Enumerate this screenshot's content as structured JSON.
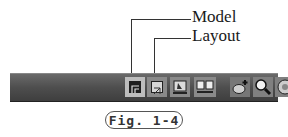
{
  "callouts": {
    "model_label": "Model",
    "layout_label": "Layout"
  },
  "statusbar": {
    "buttons": [
      {
        "name": "model-space-button",
        "icon": "model-icon",
        "active": true
      },
      {
        "name": "layout-button",
        "icon": "layout-icon",
        "active": false
      },
      {
        "name": "quick-view-layouts-button",
        "icon": "quick-view-layouts-icon",
        "active": false
      },
      {
        "name": "quick-view-drawings-button",
        "icon": "quick-view-drawings-icon",
        "active": false
      },
      {
        "name": "pan-button",
        "icon": "pan-hand-icon",
        "active": false
      },
      {
        "name": "zoom-button",
        "icon": "magnifier-icon",
        "active": false
      },
      {
        "name": "steering-wheel-button",
        "icon": "steering-wheel-icon",
        "active": false
      }
    ]
  },
  "caption": {
    "text": "Fig. 1-4"
  }
}
